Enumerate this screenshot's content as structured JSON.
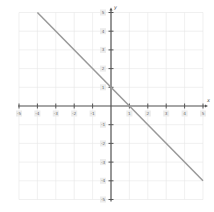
{
  "chart_data": {
    "type": "line",
    "title": "",
    "xlabel": "x",
    "ylabel": "y",
    "xlim": [
      -5,
      5
    ],
    "ylim": [
      -5,
      5
    ],
    "grid": true,
    "x_ticks": [
      -5,
      -4,
      -3,
      -2,
      -1,
      1,
      2,
      3,
      4,
      5
    ],
    "y_ticks": [
      5,
      4,
      3,
      2,
      1,
      -1,
      -2,
      -3,
      -4,
      -5
    ],
    "series": [
      {
        "name": "y = -x + 1",
        "x": [
          -4,
          5
        ],
        "y": [
          5,
          -4
        ],
        "color": "#999999"
      }
    ]
  },
  "colors": {
    "grid": "#e6e6e6",
    "axis": "#555555",
    "line": "#999999",
    "label_bg": "#ececec"
  },
  "labels": {
    "x_axis_name": "x",
    "y_axis_name": "y"
  }
}
